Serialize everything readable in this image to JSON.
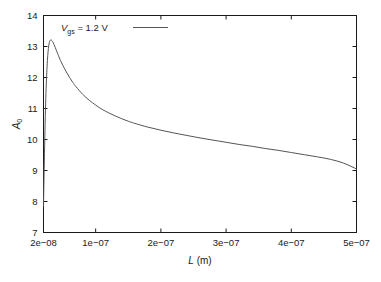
{
  "chart_data": {
    "type": "line",
    "title": "",
    "xlabel": "L (m)",
    "ylabel": "A0",
    "xlim": [
      2e-08,
      5e-07
    ],
    "ylim": [
      7,
      14
    ],
    "grid": false,
    "legend_position": "top-left-inside",
    "x_ticks": [
      "2e−08",
      "1e−07",
      "2e−07",
      "3e−07",
      "4e−07",
      "5e−07"
    ],
    "x_tick_values": [
      2e-08,
      1e-07,
      2e-07,
      3e-07,
      4e-07,
      5e-07
    ],
    "y_ticks": [
      "7",
      "8",
      "9",
      "10",
      "11",
      "12",
      "13",
      "14"
    ],
    "y_tick_values": [
      7,
      8,
      9,
      10,
      11,
      12,
      13,
      14
    ],
    "line_color": "#555555",
    "series": [
      {
        "name": "Vgs = 1.2 V",
        "x": [
          2e-08,
          2.1e-08,
          2.2e-08,
          2.3e-08,
          2.4e-08,
          2.5e-08,
          2.6e-08,
          2.7e-08,
          2.8e-08,
          2.9e-08,
          3e-08,
          3.1e-08,
          3.2e-08,
          3.3e-08,
          3.4e-08,
          3.6e-08,
          3.8e-08,
          4e-08,
          4.3e-08,
          4.6e-08,
          5e-08,
          5.5e-08,
          6e-08,
          6.5e-08,
          7e-08,
          8e-08,
          9e-08,
          1e-07,
          1.1e-07,
          1.2e-07,
          1.3e-07,
          1.4e-07,
          1.5e-07,
          1.6e-07,
          1.8e-07,
          2e-07,
          2.2e-07,
          2.4e-07,
          2.6e-07,
          2.8e-07,
          3e-07,
          3.2e-07,
          3.4e-07,
          3.6e-07,
          3.8e-07,
          4e-07,
          4.2e-07,
          4.4e-07,
          4.6e-07,
          4.8e-07,
          5e-07
        ],
        "y": [
          7.85,
          9.0,
          10.05,
          10.95,
          11.65,
          12.15,
          12.55,
          12.83,
          13.02,
          13.13,
          13.19,
          13.21,
          13.21,
          13.19,
          13.16,
          13.07,
          12.97,
          12.86,
          12.7,
          12.55,
          12.38,
          12.18,
          12.0,
          11.84,
          11.7,
          11.46,
          11.27,
          11.11,
          10.97,
          10.86,
          10.76,
          10.67,
          10.59,
          10.52,
          10.4,
          10.3,
          10.21,
          10.13,
          10.05,
          9.98,
          9.91,
          9.84,
          9.78,
          9.71,
          9.65,
          9.58,
          9.51,
          9.44,
          9.36,
          9.24,
          9.05
        ]
      }
    ],
    "legend": {
      "label_prefix": "V",
      "label_subscript": "gs",
      "label_suffix": " = 1.2 V"
    },
    "ylabel_parts": {
      "main": "A",
      "subscript": "0"
    },
    "xlabel_parts": {
      "main": "L",
      "units": " (m)"
    }
  }
}
